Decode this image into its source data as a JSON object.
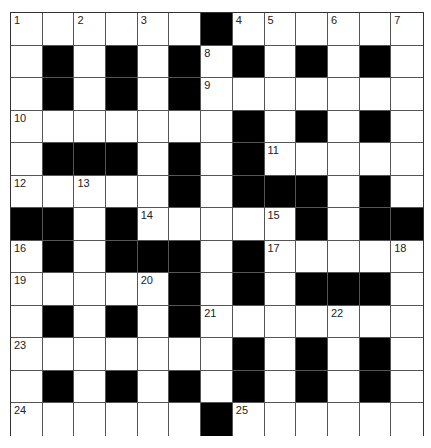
{
  "puzzle": {
    "rows": 13,
    "cols": 13,
    "colors": {
      "black": "#000000",
      "white": "#ffffff",
      "line": "#555555",
      "number": "#222222"
    },
    "grid": [
      [
        "1",
        "W",
        "2",
        "W",
        "3",
        "W",
        "B",
        "4",
        "5",
        "W",
        "6",
        "W",
        "7"
      ],
      [
        "W",
        "B",
        "W",
        "B",
        "W",
        "B",
        "8",
        "B",
        "W",
        "B",
        "W",
        "B",
        "W"
      ],
      [
        "W",
        "B",
        "W",
        "B",
        "W",
        "B",
        "9",
        "W",
        "W",
        "W",
        "W",
        "W",
        "W"
      ],
      [
        "10",
        "W",
        "W",
        "W",
        "W",
        "W",
        "W",
        "B",
        "W",
        "B",
        "W",
        "B",
        "W"
      ],
      [
        "W",
        "B",
        "B",
        "B",
        "W",
        "B",
        "W",
        "B",
        "11",
        "W",
        "W",
        "W",
        "W"
      ],
      [
        "12",
        "W",
        "13",
        "W",
        "W",
        "B",
        "W",
        "B",
        "B",
        "B",
        "W",
        "B",
        "W"
      ],
      [
        "B",
        "B",
        "W",
        "B",
        "14",
        "W",
        "W",
        "W",
        "15",
        "B",
        "W",
        "B",
        "B"
      ],
      [
        "16",
        "B",
        "W",
        "B",
        "B",
        "B",
        "W",
        "B",
        "17",
        "W",
        "W",
        "W",
        "18"
      ],
      [
        "19",
        "W",
        "W",
        "W",
        "20",
        "B",
        "W",
        "B",
        "W",
        "B",
        "B",
        "B",
        "W"
      ],
      [
        "W",
        "B",
        "W",
        "B",
        "W",
        "B",
        "21",
        "W",
        "W",
        "W",
        "22",
        "W",
        "W"
      ],
      [
        "23",
        "W",
        "W",
        "W",
        "W",
        "W",
        "W",
        "B",
        "W",
        "B",
        "W",
        "B",
        "W"
      ],
      [
        "W",
        "B",
        "W",
        "B",
        "W",
        "B",
        "W",
        "B",
        "W",
        "B",
        "W",
        "B",
        "W"
      ],
      [
        "24",
        "W",
        "W",
        "W",
        "W",
        "W",
        "B",
        "25",
        "W",
        "W",
        "W",
        "W",
        "W"
      ]
    ]
  }
}
